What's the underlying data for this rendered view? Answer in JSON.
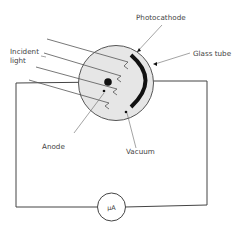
{
  "labels": {
    "photocathode": "Photocathode",
    "glass_tube": "Glass tube",
    "incident_light_line1": "Incident",
    "incident_light_line2": "light",
    "anode": "Anode",
    "vacuum": "Vacuum",
    "meter": "μA"
  },
  "colors": {
    "tube_fill": "#e6e6e6",
    "line": "#555555",
    "wire": "#444444",
    "cathode": "#111111"
  }
}
